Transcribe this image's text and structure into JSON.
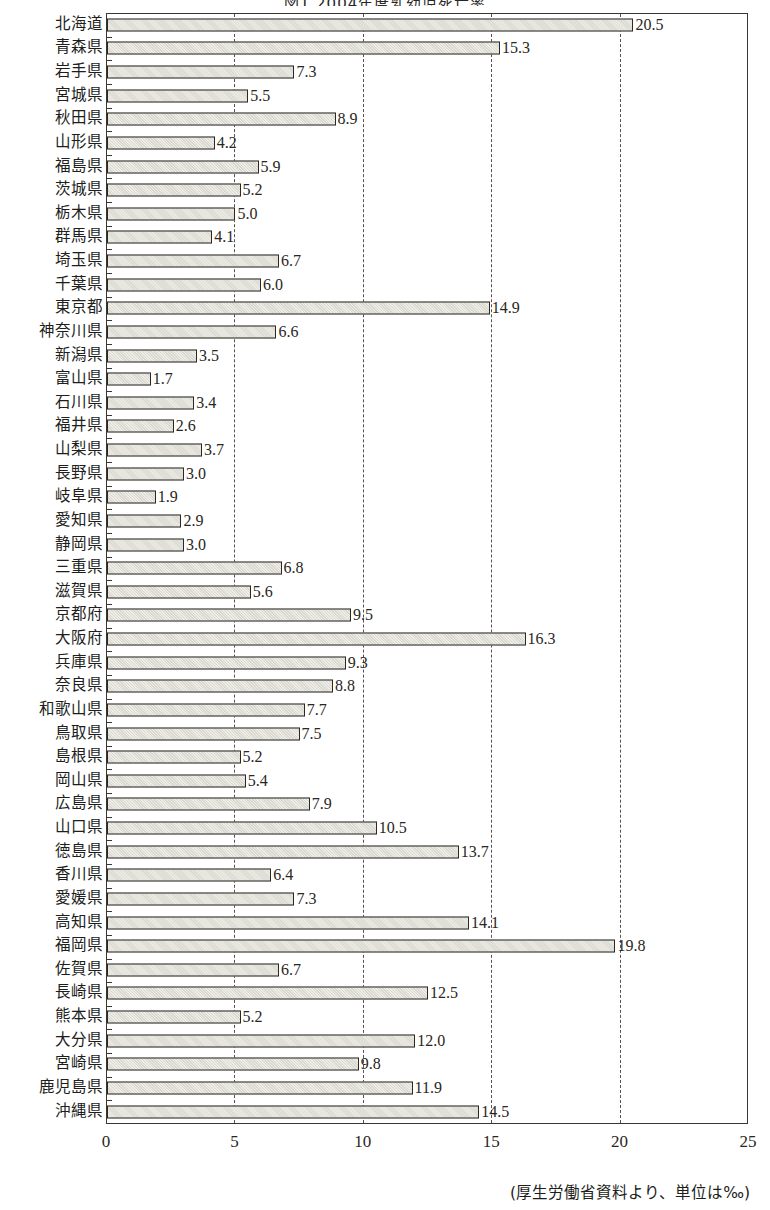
{
  "chart_data": {
    "type": "bar",
    "orientation": "horizontal",
    "title": "図1 2004年度乳幼児死亡率",
    "xlabel": "",
    "ylabel": "",
    "xlim": [
      0,
      25
    ],
    "xticks": [
      "0",
      "5",
      "10",
      "15",
      "20",
      "25"
    ],
    "xtick_values": [
      0,
      5,
      10,
      15,
      20,
      25
    ],
    "grid": "vertical dashed gridlines at 5, 10, 15, 20",
    "legend": "none",
    "unit_note": "(厚生労働省資料より、単位は‰)",
    "categories": [
      "北海道",
      "青森県",
      "岩手県",
      "宮城県",
      "秋田県",
      "山形県",
      "福島県",
      "茨城県",
      "栃木県",
      "群馬県",
      "埼玉県",
      "千葉県",
      "東京都",
      "神奈川県",
      "新潟県",
      "富山県",
      "石川県",
      "福井県",
      "山梨県",
      "長野県",
      "岐阜県",
      "愛知県",
      "静岡県",
      "三重県",
      "滋賀県",
      "京都府",
      "大阪府",
      "兵庫県",
      "奈良県",
      "和歌山県",
      "鳥取県",
      "島根県",
      "岡山県",
      "広島県",
      "山口県",
      "徳島県",
      "香川県",
      "愛媛県",
      "高知県",
      "福岡県",
      "佐賀県",
      "長崎県",
      "熊本県",
      "大分県",
      "宮崎県",
      "鹿児島県",
      "沖縄県"
    ],
    "values": [
      20.5,
      15.3,
      7.3,
      5.5,
      8.9,
      4.2,
      5.9,
      5.2,
      5.0,
      4.1,
      6.7,
      6.0,
      14.9,
      6.6,
      3.5,
      1.7,
      3.4,
      2.6,
      3.7,
      3.0,
      1.9,
      2.9,
      3.0,
      6.8,
      5.6,
      9.5,
      16.3,
      9.3,
      8.8,
      7.7,
      7.5,
      5.2,
      5.4,
      7.9,
      10.5,
      13.7,
      6.4,
      7.3,
      14.1,
      19.8,
      6.7,
      12.5,
      5.2,
      12.0,
      9.8,
      11.9,
      14.5
    ],
    "value_labels": [
      "20.5",
      "15.3",
      "7.3",
      "5.5",
      "8.9",
      "4.2",
      "5.9",
      "5.2",
      "5.0",
      "4.1",
      "6.7",
      "6.0",
      "14.9",
      "6.6",
      "3.5",
      "1.7",
      "3.4",
      "2.6",
      "3.7",
      "3.0",
      "1.9",
      "2.9",
      "3.0",
      "6.8",
      "5.6",
      "9.5",
      "16.3",
      "9.3",
      "8.8",
      "7.7",
      "7.5",
      "5.2",
      "5.4",
      "7.9",
      "10.5",
      "13.7",
      "6.4",
      "7.3",
      "14.1",
      "19.8",
      "6.7",
      "12.5",
      "5.2",
      "12.0",
      "9.8",
      "11.9",
      "14.5"
    ],
    "colors": {
      "bar_fill": "#d9d8cf",
      "bar_border": "#2b2824",
      "grid": "#56514c",
      "text": "#201d1a",
      "background": "#ffffff"
    }
  }
}
